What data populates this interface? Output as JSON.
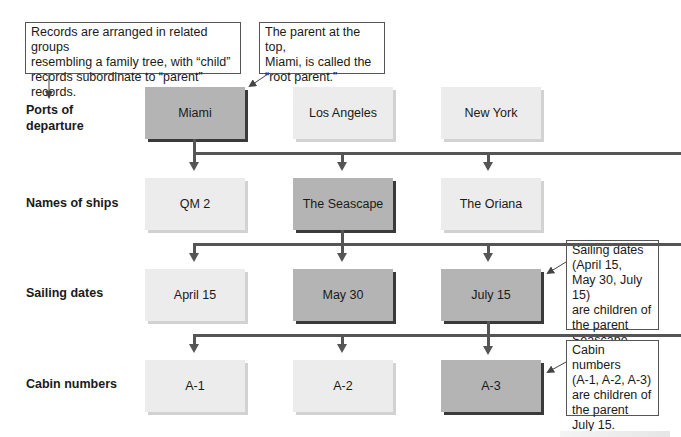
{
  "callouts": {
    "intro": "Records are arranged in related groups\nresembling a family tree, with “child”\nrecords subordinate to “parent” records.",
    "root": "The parent at the top,\nMiami, is called the\n“root parent.”",
    "sailing": "Sailing dates\n(April 15,\nMay 30, July 15)\nare children of\nthe parent\nSeascape.",
    "cabin": "Cabin numbers\n(A-1, A-2, A-3)\nare children of\nthe parent\nJuly 15."
  },
  "rows": [
    {
      "label": "Ports of\ndeparture",
      "nodes": [
        {
          "text": "Miami",
          "highlighted": true
        },
        {
          "text": "Los Angeles",
          "highlighted": false
        },
        {
          "text": "New York",
          "highlighted": false
        }
      ]
    },
    {
      "label": "Names of ships",
      "nodes": [
        {
          "text": "QM 2",
          "highlighted": false
        },
        {
          "text": "The Seascape",
          "highlighted": true
        },
        {
          "text": "The Oriana",
          "highlighted": false
        }
      ]
    },
    {
      "label": "Sailing dates",
      "nodes": [
        {
          "text": "April 15",
          "highlighted": false
        },
        {
          "text": "May 30",
          "highlighted": true
        },
        {
          "text": "July 15",
          "highlighted": true
        }
      ]
    },
    {
      "label": "Cabin numbers",
      "nodes": [
        {
          "text": "A-1",
          "highlighted": false
        },
        {
          "text": "A-2",
          "highlighted": false
        },
        {
          "text": "A-3",
          "highlighted": true
        }
      ]
    }
  ],
  "colors": {
    "highlighted_node": "#b4b4b4",
    "plain_node": "#ececec",
    "connector": "#555555"
  }
}
